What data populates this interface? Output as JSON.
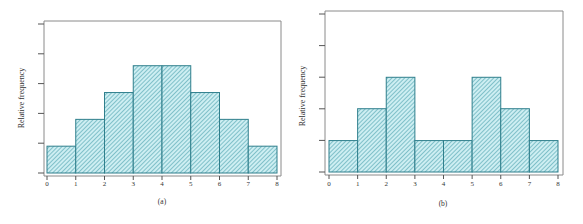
{
  "chart_data": [
    {
      "type": "bar",
      "histogram": true,
      "panel_label": "(a)",
      "title": "",
      "xlabel": "",
      "ylabel": "Relative frequency",
      "bin_edges": [
        0,
        1,
        2,
        3,
        4,
        5,
        6,
        7,
        8
      ],
      "categories": [
        "0-1",
        "1-2",
        "2-3",
        "3-4",
        "4-5",
        "5-6",
        "6-7",
        "7-8"
      ],
      "values": [
        0.05,
        0.1,
        0.15,
        0.2,
        0.2,
        0.15,
        0.1,
        0.05
      ],
      "x_ticks": [
        "0",
        "1",
        "2",
        "3",
        "4",
        "5",
        "6",
        "7",
        "8"
      ],
      "y_ticks_count": 6,
      "y_tick_labels": [],
      "ylim": [
        0,
        0.5
      ],
      "grid": false,
      "legend": null,
      "bar_fill": "#cdeef2",
      "bar_hatch_color": "#3f9aa8",
      "bar_edge": "#2f7f8c"
    },
    {
      "type": "bar",
      "histogram": true,
      "panel_label": "(b)",
      "title": "",
      "xlabel": "",
      "ylabel": "Relative frequency",
      "bin_edges": [
        0,
        1,
        2,
        3,
        4,
        5,
        6,
        7,
        8
      ],
      "categories": [
        "0-1",
        "1-2",
        "2-3",
        "3-4",
        "4-5",
        "5-6",
        "6-7",
        "7-8"
      ],
      "values": [
        0.071,
        0.143,
        0.214,
        0.071,
        0.071,
        0.214,
        0.143,
        0.071
      ],
      "x_ticks": [
        "0",
        "1",
        "2",
        "3",
        "4",
        "5",
        "6",
        "7",
        "8"
      ],
      "y_ticks_count": 6,
      "y_tick_labels": [],
      "ylim": [
        0,
        0.5
      ],
      "grid": false,
      "legend": null,
      "bar_fill": "#cdeef2",
      "bar_hatch_color": "#3f9aa8",
      "bar_edge": "#2f7f8c"
    }
  ],
  "panels": [
    {
      "caption": "(a)",
      "ylabel": "Relative frequency",
      "x_ticks": [
        "0",
        "1",
        "2",
        "3",
        "4",
        "5",
        "6",
        "7",
        "8"
      ]
    },
    {
      "caption": "(b)",
      "ylabel": "Relative frequency",
      "x_ticks": [
        "0",
        "1",
        "2",
        "3",
        "4",
        "5",
        "6",
        "7",
        "8"
      ]
    }
  ]
}
